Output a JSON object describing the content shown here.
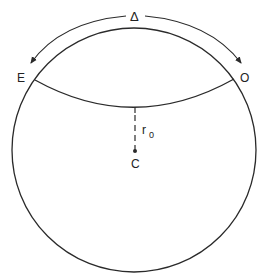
{
  "diagram": {
    "labels": {
      "delta": "Δ",
      "east": "E",
      "west": "O",
      "radius": "r",
      "radius_subscript": "0",
      "center": "C"
    },
    "colors": {
      "stroke": "#2a2a2a",
      "background": "#ffffff"
    }
  }
}
